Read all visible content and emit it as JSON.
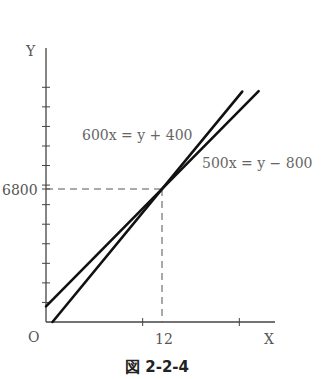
{
  "chart_data": {
    "type": "line",
    "title": "",
    "caption": "図 2-2-4",
    "xlabel": "X",
    "ylabel": "Y",
    "origin_label": "O",
    "xlim": [
      0,
      23.5
    ],
    "ylim": [
      0,
      14000
    ],
    "x_ticks": [
      10,
      20
    ],
    "y_ticks": [
      1000,
      2000,
      3000,
      4000,
      5000,
      6000,
      7000,
      8000,
      9000,
      10000,
      11000,
      12000
    ],
    "x_tick_labels": [
      {
        "value": 12,
        "label": "12"
      }
    ],
    "y_tick_labels": [
      {
        "value": 6800,
        "label": "6800"
      }
    ],
    "grid": false,
    "series": [
      {
        "name": "600x=y+400",
        "equation_label": "600x = y + 400",
        "slope": 600,
        "intercept": -400,
        "x": [
          0.67,
          20.3
        ]
      },
      {
        "name": "500x=y-800",
        "equation_label": "500x = y − 800",
        "slope": 500,
        "intercept": 800,
        "x": [
          0,
          22.0
        ]
      }
    ],
    "annotations": [
      {
        "type": "intersection",
        "x": 12,
        "y": 6800,
        "guides": "dashed"
      }
    ]
  }
}
